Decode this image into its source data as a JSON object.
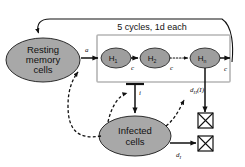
{
  "diagram": {
    "background_color": "#ffffff",
    "node_fill_color": "#a8a8a8",
    "node_stroke_color": "#2b2b2b",
    "box_frame_color": "#b5b5b5",
    "edge_color": "#111111"
  },
  "nodes": {
    "resting": {
      "line1": "Resting",
      "line2": "memory",
      "line3": "cells"
    },
    "infected": {
      "line1": "Infected",
      "line2": "cells"
    },
    "proliferation": {
      "h1_base": "H",
      "h1_sub": "1",
      "h2_base": "H",
      "h2_sub": "2",
      "hn_base": "H",
      "hn_sub": "n"
    }
  },
  "annotations": {
    "cycles_label": "5 cycles,  1d  each",
    "activation_rate": "a",
    "cycle_rate_1": "c",
    "cycle_rate_2": "c",
    "cycle_rate_3": "c",
    "infection_rate": "i",
    "death_rate_h_base": "d",
    "death_rate_h_sub": "H",
    "death_rate_h_arg": "(I)",
    "death_rate_i_base": "d",
    "death_rate_i_sub": "I"
  },
  "icons": {
    "death_sink_1": "crossed-box-icon",
    "death_sink_2": "crossed-box-icon",
    "inhibition_arrow": "t-bar-inhibition-icon",
    "feedback_arrow": "curved-feedback-arrow-icon"
  }
}
